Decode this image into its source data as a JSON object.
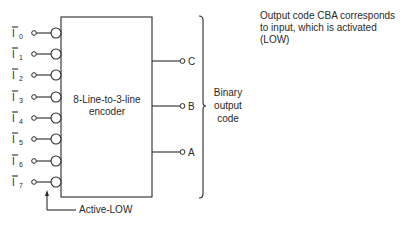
{
  "diagram": {
    "type": "logic-block-diagram",
    "block": {
      "label_line1": "8-Line-to-3-line",
      "label_line2": "encoder"
    },
    "inputs": [
      {
        "name": "I",
        "sub": "0",
        "inverted": true
      },
      {
        "name": "I",
        "sub": "1",
        "inverted": true
      },
      {
        "name": "I",
        "sub": "2",
        "inverted": true
      },
      {
        "name": "I",
        "sub": "3",
        "inverted": true
      },
      {
        "name": "I",
        "sub": "4",
        "inverted": true
      },
      {
        "name": "I",
        "sub": "5",
        "inverted": true
      },
      {
        "name": "I",
        "sub": "6",
        "inverted": true
      },
      {
        "name": "I",
        "sub": "7",
        "inverted": true
      }
    ],
    "outputs": [
      {
        "label": "C"
      },
      {
        "label": "B"
      },
      {
        "label": "A"
      }
    ],
    "brace_label": {
      "line1": "Binary",
      "line2": "output",
      "line3": "code"
    },
    "annotation_active_low": "Active-LOW",
    "note": {
      "line1": "Output code CBA corresponds",
      "line2": "to input, which is activated",
      "line3": "(LOW)"
    },
    "colors": {
      "ink": "#2a2a2a",
      "background": "#ffffff"
    }
  }
}
